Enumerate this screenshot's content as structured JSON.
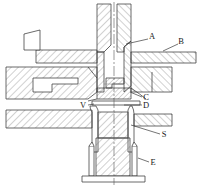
{
  "figure": {
    "type": "engineering-cross-section-drawing",
    "title": "",
    "background_color": "#ffffff",
    "line_color": "#3a3a3a",
    "hatch_color": "#6b6b6b",
    "label_color": "#1a1a1a"
  },
  "callouts": [
    {
      "id": "A",
      "label": "A",
      "x": 152,
      "y": 36,
      "leader_from_x": 148,
      "leader_from_y": 39,
      "leader_to_x": 126,
      "leader_to_y": 44
    },
    {
      "id": "B",
      "label": "B",
      "x": 181,
      "y": 41,
      "leader_from_x": 178,
      "leader_from_y": 44,
      "leader_to_x": 163,
      "leader_to_y": 51
    },
    {
      "id": "C",
      "label": "C",
      "x": 145,
      "y": 99,
      "leader_from_x": 142,
      "leader_from_y": 97,
      "leader_to_x": 130,
      "leader_to_y": 92
    },
    {
      "id": "D",
      "label": "D",
      "x": 145,
      "y": 107,
      "leader_from_x": 142,
      "leader_from_y": 105,
      "leader_to_x": 124,
      "leader_to_y": 105
    },
    {
      "id": "V",
      "label": "V",
      "x": 82,
      "y": 107,
      "leader_from_x": 88,
      "leader_from_y": 105,
      "leader_to_x": 94,
      "leader_to_y": 104
    },
    {
      "id": "S",
      "label": "S",
      "x": 163,
      "y": 136,
      "leader_from_x": 160,
      "leader_from_y": 134,
      "leader_to_x": 131,
      "leader_to_y": 125
    },
    {
      "id": "E",
      "label": "E",
      "x": 152,
      "y": 164,
      "leader_from_x": 149,
      "leader_from_y": 162,
      "leader_to_x": 138,
      "leader_to_y": 158
    }
  ],
  "geometry": {
    "centerline_x": 114,
    "centerline_top_y": 2,
    "centerline_bottom_y": 185,
    "parts": [
      {
        "name": "upper-stem-left-wall",
        "hatched": true
      },
      {
        "name": "upper-stem-right-wall",
        "hatched": true
      },
      {
        "name": "left-flange-arm",
        "hatched": true
      },
      {
        "name": "right-flange-arm",
        "hatched": true
      },
      {
        "name": "left-body-block",
        "hatched": true
      },
      {
        "name": "right-body-block",
        "hatched": true
      },
      {
        "name": "seat-ring",
        "hatched": true
      },
      {
        "name": "lower-sleeve",
        "hatched": true
      },
      {
        "name": "lower-shaft",
        "hatched": true
      },
      {
        "name": "base-plate",
        "hatched": true
      }
    ]
  }
}
